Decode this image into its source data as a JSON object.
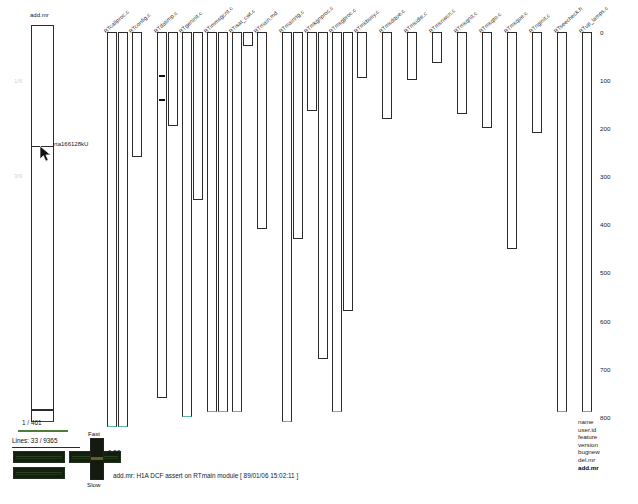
{
  "app": {
    "title": "add.mr",
    "status": "add.mr: H1A DCF assert on RTmain module [ 89/01/06 15:02:11 ]"
  },
  "summary": {
    "title": "add.mr",
    "tooltip": "rta166128kU",
    "ghost_top": "1/6",
    "ghost_bottom": "3/9",
    "cursor_icon": "arrow-cursor"
  },
  "axis": {
    "title": "lines",
    "ticks": [
      "0",
      "100",
      "200",
      "300",
      "400",
      "500",
      "600",
      "700",
      "800"
    ],
    "min": 0,
    "max": 800
  },
  "columns": [
    {
      "label": "RTcallproc.c",
      "segments": [
        820,
        820
      ]
    },
    {
      "label": "RTconfig.c",
      "segments": [
        260
      ]
    },
    {
      "label": "RTdatimp.c",
      "segments": [
        760,
        195
      ],
      "marks": [
        90,
        140
      ]
    },
    {
      "label": "RTgeninit.c",
      "segments": [
        800,
        350
      ]
    },
    {
      "label": "RTimmsgcnt.c",
      "segments": [
        790,
        790
      ]
    },
    {
      "label": "RTisat_cwt.c",
      "segments": [
        790,
        30
      ]
    },
    {
      "label": "RTmain.md",
      "segments": [
        410
      ]
    },
    {
      "label": "RTmainrtg.c",
      "segments": [
        810,
        430
      ]
    },
    {
      "label": "RTmkgnproc.c",
      "segments": [
        165,
        680
      ]
    },
    {
      "label": "RTmsgproc.c",
      "segments": [
        790,
        580
      ]
    },
    {
      "label": "RTmsbusy.c",
      "segments": [
        95
      ]
    },
    {
      "label": "RTmsdque.c",
      "segments": [
        180
      ]
    },
    {
      "label": "RTmsidle.c",
      "segments": [
        100
      ]
    },
    {
      "label": "RTmsnwcn.c",
      "segments": [
        65
      ]
    },
    {
      "label": "RTmsqnit.c",
      "segments": [
        170
      ]
    },
    {
      "label": "RTmsqto.c",
      "segments": [
        200
      ]
    },
    {
      "label": "RTmsque.c",
      "segments": [
        450
      ]
    },
    {
      "label": "RTnginit.c",
      "segments": [
        210
      ]
    },
    {
      "label": "RTseecheck.h",
      "segments": [
        790
      ]
    },
    {
      "label": "RTup_lamps.c",
      "segments": [
        790
      ]
    }
  ],
  "panel": {
    "page_counter": "1 / 461",
    "line_counter": "Lines: 33 / 9365",
    "buttons": [
      {
        "name": "panel-button-1",
        "label": ""
      },
      {
        "name": "panel-button-2",
        "label": ""
      },
      {
        "name": "panel-button-3",
        "label": ""
      }
    ]
  },
  "speed": {
    "fast_label": "Fast",
    "slow_label": "Slow",
    "value": "0.50"
  },
  "legend": {
    "items": [
      {
        "label": "name",
        "selected": false
      },
      {
        "label": "user.id",
        "selected": false
      },
      {
        "label": "feature",
        "selected": false
      },
      {
        "label": "version",
        "selected": false
      },
      {
        "label": "bugnew",
        "selected": false
      },
      {
        "label": "del.mr",
        "selected": false
      },
      {
        "label": "add.mr",
        "selected": true
      }
    ]
  },
  "colors": {
    "stroke": "#2b2b2b",
    "teal": "#57b9a8",
    "accent_green": "#4d7d36",
    "panel_dark": "#14200f"
  }
}
